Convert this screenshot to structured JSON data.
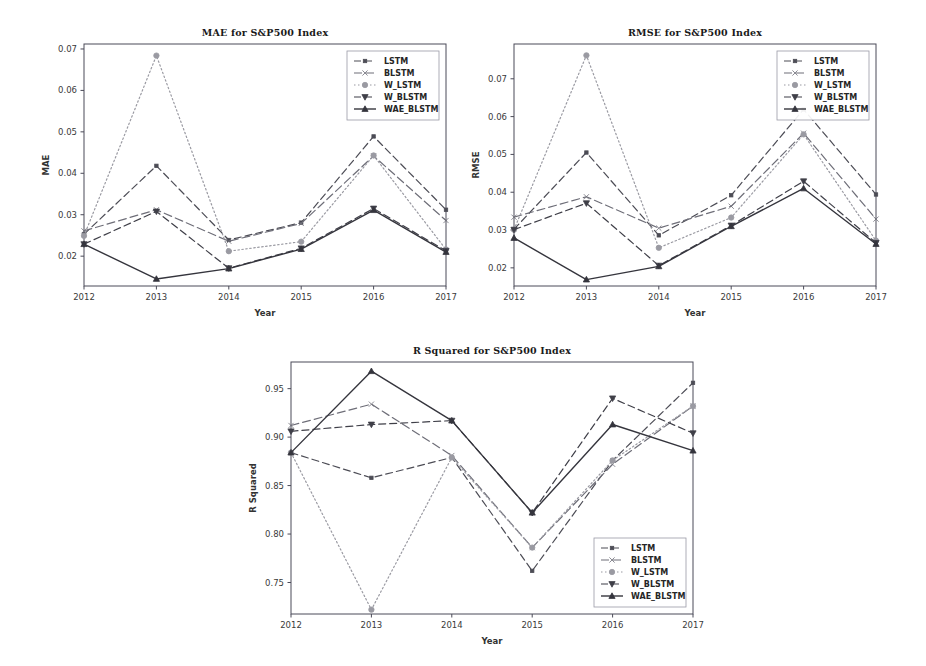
{
  "figure": {
    "name": "model-evaluation-figure",
    "background": "#ffffff",
    "width": 926,
    "height": 666
  },
  "series_styles": {
    "LSTM": {
      "color": "#4c4c55",
      "dash": "7,4",
      "marker": "square-small",
      "width": 1.2
    },
    "BLSTM": {
      "color": "#6e6e78",
      "dash": "8,4",
      "marker": "x",
      "width": 1.2
    },
    "W_LSTM": {
      "color": "#9a9aa2",
      "dash": "1.5,2.5",
      "marker": "circle",
      "width": 1.2
    },
    "W_BLSTM": {
      "color": "#3f3f48",
      "dash": "7,4",
      "marker": "triangle-down",
      "width": 1.2
    },
    "WAE_BLSTM": {
      "color": "#35353d",
      "dash": "none",
      "marker": "triangle-up",
      "width": 1.4
    }
  },
  "charts": [
    {
      "id": "mae",
      "panel_name": "chart-panel-mae",
      "chart_data": {
        "type": "line",
        "title": "MAE for S&P500 Index",
        "xlabel": "Year",
        "ylabel": "MAE",
        "categories": [
          "2012",
          "2013",
          "2014",
          "2015",
          "2016",
          "2017"
        ],
        "x": [
          2012,
          2013,
          2014,
          2015,
          2016,
          2017
        ],
        "xlim": [
          2012,
          2017
        ],
        "ylim": [
          0.0128,
          0.0712
        ],
        "yticks": [
          0.02,
          0.03,
          0.04,
          0.05,
          0.06,
          0.07
        ],
        "ytick_labels": [
          "0.02",
          "0.03",
          "0.04",
          "0.05",
          "0.06",
          "0.07"
        ],
        "grid": false,
        "legend_position": "upper-right",
        "series": [
          {
            "name": "LSTM",
            "values": [
              0.0253,
              0.0418,
              0.0239,
              0.0281,
              0.0489,
              0.0312
            ]
          },
          {
            "name": "BLSTM",
            "values": [
              0.0261,
              0.0312,
              0.0236,
              0.0279,
              0.0442,
              0.0286
            ]
          },
          {
            "name": "W_LSTM",
            "values": [
              0.0249,
              0.0684,
              0.0212,
              0.0235,
              0.0443,
              0.0216
            ]
          },
          {
            "name": "W_BLSTM",
            "values": [
              0.0229,
              0.0308,
              0.0171,
              0.0219,
              0.0315,
              0.0213
            ]
          },
          {
            "name": "WAE_BLSTM",
            "values": [
              0.0229,
              0.0145,
              0.017,
              0.0217,
              0.0311,
              0.021
            ]
          }
        ]
      }
    },
    {
      "id": "rmse",
      "panel_name": "chart-panel-rmse",
      "chart_data": {
        "type": "line",
        "title": "RMSE for S&P500 Index",
        "xlabel": "Year",
        "ylabel": "RMSE",
        "categories": [
          "2012",
          "2013",
          "2014",
          "2015",
          "2016",
          "2017"
        ],
        "x": [
          2012,
          2013,
          2014,
          2015,
          2016,
          2017
        ],
        "xlim": [
          2012,
          2017
        ],
        "ylim": [
          0.0152,
          0.0792
        ],
        "yticks": [
          0.02,
          0.03,
          0.04,
          0.05,
          0.06,
          0.07
        ],
        "ytick_labels": [
          "0.02",
          "0.03",
          "0.04",
          "0.05",
          "0.06",
          "0.07"
        ],
        "grid": false,
        "legend_position": "upper-right",
        "series": [
          {
            "name": "LSTM",
            "values": [
              0.0302,
              0.0505,
              0.0286,
              0.0392,
              0.0619,
              0.0394
            ]
          },
          {
            "name": "BLSTM",
            "values": [
              0.0334,
              0.0388,
              0.0305,
              0.0363,
              0.0556,
              0.0329
            ]
          },
          {
            "name": "W_LSTM",
            "values": [
              0.0301,
              0.0762,
              0.0253,
              0.0333,
              0.0553,
              0.0272
            ]
          },
          {
            "name": "W_BLSTM",
            "values": [
              0.0301,
              0.0371,
              0.0206,
              0.0312,
              0.0429,
              0.0266
            ]
          },
          {
            "name": "WAE_BLSTM",
            "values": [
              0.0279,
              0.0169,
              0.0204,
              0.031,
              0.041,
              0.0263
            ]
          }
        ]
      }
    },
    {
      "id": "r2",
      "panel_name": "chart-panel-r-squared",
      "chart_data": {
        "type": "line",
        "title": "R Squared for S&P500 Index",
        "xlabel": "Year",
        "ylabel": "R Squared",
        "categories": [
          "2012",
          "2013",
          "2014",
          "2015",
          "2016",
          "2017"
        ],
        "x": [
          2012,
          2013,
          2014,
          2015,
          2016,
          2017
        ],
        "xlim": [
          2012,
          2017
        ],
        "ylim": [
          0.7175,
          0.9775
        ],
        "yticks": [
          0.75,
          0.8,
          0.85,
          0.9,
          0.95
        ],
        "ytick_labels": [
          "0.75",
          "0.80",
          "0.85",
          "0.90",
          "0.95"
        ],
        "grid": false,
        "legend_position": "lower-right",
        "series": [
          {
            "name": "LSTM",
            "values": [
              0.884,
              0.858,
              0.879,
              0.762,
              0.876,
              0.956
            ]
          },
          {
            "name": "BLSTM",
            "values": [
              0.912,
              0.934,
              0.881,
              0.786,
              0.872,
              0.932
            ]
          },
          {
            "name": "W_LSTM",
            "values": [
              0.884,
              0.722,
              0.879,
              0.786,
              0.876,
              0.932
            ]
          },
          {
            "name": "W_BLSTM",
            "values": [
              0.906,
              0.913,
              0.917,
              0.822,
              0.94,
              0.904
            ]
          },
          {
            "name": "WAE_BLSTM",
            "values": [
              0.884,
              0.968,
              0.917,
              0.822,
              0.913,
              0.886
            ]
          }
        ]
      }
    }
  ],
  "legend": {
    "entries": [
      "LSTM",
      "BLSTM",
      "W_LSTM",
      "W_BLSTM",
      "WAE_BLSTM"
    ]
  }
}
